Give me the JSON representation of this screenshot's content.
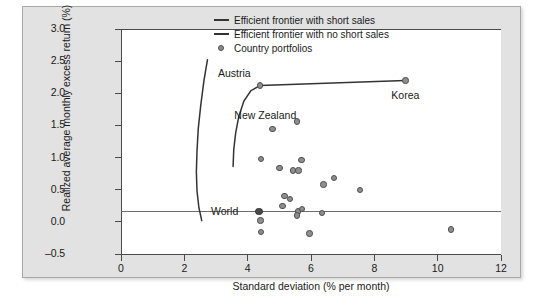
{
  "chart_data": {
    "type": "scatter",
    "title": "",
    "xlabel": "Standard deviation (% per month)",
    "ylabel": "Realized average monthly excess return (%)",
    "xlim": [
      0,
      12
    ],
    "ylim": [
      -0.5,
      3.0
    ],
    "xticks": [
      "0",
      "2",
      "4",
      "6",
      "8",
      "10",
      "12"
    ],
    "yticks": [
      "3.0",
      "2.5",
      "2.0",
      "1.5",
      "1.0",
      "0.5",
      "0.0",
      "-0.5"
    ],
    "grid": false,
    "zero_reference_line": 0.0,
    "legend_position": "top-right",
    "legend": [
      {
        "key": "line",
        "label": "Efficient frontier with short sales"
      },
      {
        "key": "line",
        "label": "Efficient frontier with no short sales"
      },
      {
        "key": "marker",
        "label": "Country portfolios"
      }
    ],
    "series": [
      {
        "name": "Country portfolios",
        "type": "scatter",
        "points": [
          {
            "x": 4.39,
            "y": 2.12,
            "label": "Austria"
          },
          {
            "x": 8.98,
            "y": 2.2,
            "label": "Korea"
          },
          {
            "x": 4.78,
            "y": 1.44,
            "label": "New Zealand"
          },
          {
            "x": 5.55,
            "y": 1.56
          },
          {
            "x": 4.42,
            "y": 0.98
          },
          {
            "x": 5.7,
            "y": 0.96
          },
          {
            "x": 5.0,
            "y": 0.84
          },
          {
            "x": 5.44,
            "y": 0.8
          },
          {
            "x": 5.6,
            "y": 0.8
          },
          {
            "x": 6.72,
            "y": 0.68
          },
          {
            "x": 6.4,
            "y": 0.58
          },
          {
            "x": 7.55,
            "y": 0.5
          },
          {
            "x": 5.16,
            "y": 0.4
          },
          {
            "x": 5.33,
            "y": 0.36
          },
          {
            "x": 5.1,
            "y": 0.25
          },
          {
            "x": 5.58,
            "y": 0.16
          },
          {
            "x": 5.72,
            "y": 0.2
          },
          {
            "x": 5.56,
            "y": 0.1
          },
          {
            "x": 6.35,
            "y": 0.14
          },
          {
            "x": 4.36,
            "y": 0.16,
            "label": "World",
            "highlight": true
          },
          {
            "x": 4.4,
            "y": 0.02
          },
          {
            "x": 4.42,
            "y": -0.16
          },
          {
            "x": 5.95,
            "y": -0.18
          },
          {
            "x": 10.42,
            "y": -0.12
          }
        ]
      },
      {
        "name": "Efficient frontier with short sales",
        "type": "line",
        "points": [
          {
            "x": 2.73,
            "y": 2.52
          },
          {
            "x": 2.62,
            "y": 2.2
          },
          {
            "x": 2.52,
            "y": 1.82
          },
          {
            "x": 2.44,
            "y": 1.45
          },
          {
            "x": 2.4,
            "y": 1.1
          },
          {
            "x": 2.38,
            "y": 0.78
          },
          {
            "x": 2.4,
            "y": 0.48
          },
          {
            "x": 2.46,
            "y": 0.22
          },
          {
            "x": 2.55,
            "y": 0.02
          }
        ]
      },
      {
        "name": "Efficient frontier with no short sales",
        "type": "line",
        "points": [
          {
            "x": 4.39,
            "y": 2.12
          },
          {
            "x": 4.1,
            "y": 2.04
          },
          {
            "x": 3.88,
            "y": 1.88
          },
          {
            "x": 3.72,
            "y": 1.64
          },
          {
            "x": 3.62,
            "y": 1.38
          },
          {
            "x": 3.56,
            "y": 1.12
          },
          {
            "x": 3.54,
            "y": 0.86
          }
        ]
      },
      {
        "name": "Austria-Korea connector",
        "type": "line",
        "points": [
          {
            "x": 4.39,
            "y": 2.12
          },
          {
            "x": 8.98,
            "y": 2.2
          }
        ]
      }
    ],
    "annotations": [
      {
        "text": "Austria",
        "x": 4.39,
        "y": 2.12,
        "dx": -42,
        "dy": -12
      },
      {
        "text": "Korea",
        "x": 8.98,
        "y": 2.2,
        "dx": -14,
        "dy": 16
      },
      {
        "text": "New Zealand",
        "x": 4.78,
        "y": 1.44,
        "dx": -38,
        "dy": -13
      },
      {
        "text": "World",
        "x": 4.36,
        "y": 0.16,
        "dx": -48,
        "dy": 0
      }
    ]
  }
}
